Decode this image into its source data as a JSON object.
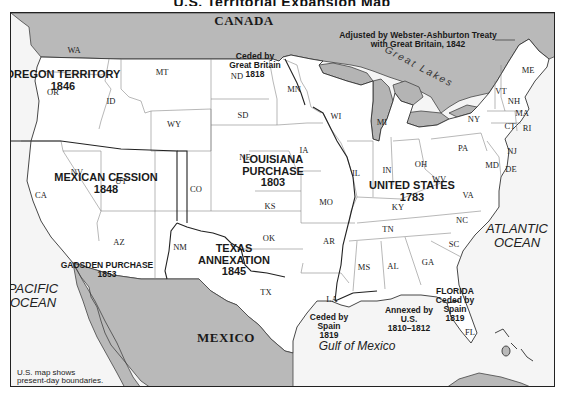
{
  "title_fragment": "U.S. Territorial Expansion Map",
  "colors": {
    "foreign_land": "#b9b9b9",
    "us_land": "#ffffff",
    "water": "#f5f5f5",
    "lakes": "#b4b4b4",
    "state_border": "#777777",
    "acquisition_border": "#222222",
    "frame": "#222222"
  },
  "countries": [
    {
      "id": "canada",
      "label": "CANADA",
      "x": 243,
      "y": 20
    },
    {
      "id": "mexico",
      "label": "MEXICO",
      "x": 225,
      "y": 337
    }
  ],
  "water_bodies": [
    {
      "id": "pacific",
      "label": "PACIFIC\nOCEAN",
      "x": 32,
      "y": 295,
      "cls": "ocean"
    },
    {
      "id": "atlantic",
      "label": "ATLANTIC\nOCEAN",
      "x": 516,
      "y": 235,
      "cls": "ocean"
    },
    {
      "id": "gulf",
      "label": "Gulf of Mexico",
      "x": 356,
      "y": 345,
      "cls": "gulf"
    },
    {
      "id": "great-lakes",
      "label": "Great Lakes",
      "x": 418,
      "y": 66,
      "cls": "lakes"
    }
  ],
  "acquisitions": [
    {
      "id": "oregon-territory",
      "label": "OREGON TERRITORY\n1846",
      "x": 62,
      "y": 80,
      "cls": "region"
    },
    {
      "id": "mexican-cession",
      "label": "MEXICAN CESSION\n1848",
      "x": 105,
      "y": 183,
      "cls": "region"
    },
    {
      "id": "louisiana-purchase",
      "label": "LOUISIANA\nPURCHASE\n1803",
      "x": 272,
      "y": 170,
      "cls": "region"
    },
    {
      "id": "united-states-1783",
      "label": "UNITED STATES\n1783",
      "x": 411,
      "y": 191,
      "cls": "region"
    },
    {
      "id": "texas-annexation",
      "label": "TEXAS\nANNEXATION\n1845",
      "x": 233,
      "y": 259,
      "cls": "region"
    },
    {
      "id": "gadsden-purchase",
      "label": "GADSDEN PURCHASE\n1853",
      "x": 106,
      "y": 269,
      "cls": "region-sm"
    },
    {
      "id": "ceded-by-great-britain",
      "label": "Ceded by\nGreat Britain\n1818",
      "x": 254,
      "y": 64,
      "cls": "region-sm"
    },
    {
      "id": "ceded-by-spain",
      "label": "Ceded by\nSpain\n1819",
      "x": 328,
      "y": 325,
      "cls": "region-sm"
    },
    {
      "id": "annexed-by-us",
      "label": "Annexed by\nU.S.\n1810–1812",
      "x": 408,
      "y": 318,
      "cls": "region-sm"
    },
    {
      "id": "florida",
      "label": "FLORIDA\nCeded by\nSpain\n1819",
      "x": 454,
      "y": 304,
      "cls": "region-sm"
    },
    {
      "id": "webster-ashburton",
      "label": "Adjusted by Webster-Ashburton Treaty\nwith Great Britain, 1842",
      "x": 417,
      "y": 39,
      "cls": "region-sm"
    }
  ],
  "states": [
    {
      "abbr": "WA",
      "x": 73,
      "y": 49
    },
    {
      "abbr": "OR",
      "x": 52,
      "y": 91
    },
    {
      "abbr": "ID",
      "x": 110,
      "y": 100
    },
    {
      "abbr": "MT",
      "x": 161,
      "y": 71
    },
    {
      "abbr": "WY",
      "x": 173,
      "y": 123
    },
    {
      "abbr": "ND",
      "x": 236,
      "y": 75
    },
    {
      "abbr": "SD",
      "x": 242,
      "y": 114
    },
    {
      "abbr": "MN",
      "x": 293,
      "y": 88
    },
    {
      "abbr": "WI",
      "x": 335,
      "y": 115
    },
    {
      "abbr": "MI",
      "x": 381,
      "y": 121
    },
    {
      "abbr": "NE",
      "x": 244,
      "y": 156
    },
    {
      "abbr": "IA",
      "x": 303,
      "y": 149
    },
    {
      "abbr": "IL",
      "x": 355,
      "y": 172
    },
    {
      "abbr": "IN",
      "x": 386,
      "y": 169
    },
    {
      "abbr": "OH",
      "x": 420,
      "y": 163
    },
    {
      "abbr": "PA",
      "x": 462,
      "y": 147
    },
    {
      "abbr": "NY",
      "x": 473,
      "y": 118
    },
    {
      "abbr": "NV",
      "x": 76,
      "y": 171
    },
    {
      "abbr": "UT",
      "x": 120,
      "y": 180
    },
    {
      "abbr": "CA",
      "x": 40,
      "y": 194
    },
    {
      "abbr": "CO",
      "x": 195,
      "y": 188
    },
    {
      "abbr": "KS",
      "x": 269,
      "y": 205
    },
    {
      "abbr": "MO",
      "x": 325,
      "y": 201
    },
    {
      "abbr": "KY",
      "x": 397,
      "y": 206
    },
    {
      "abbr": "WV",
      "x": 438,
      "y": 178
    },
    {
      "abbr": "VA",
      "x": 467,
      "y": 194
    },
    {
      "abbr": "AZ",
      "x": 118,
      "y": 241
    },
    {
      "abbr": "NM",
      "x": 179,
      "y": 246
    },
    {
      "abbr": "OK",
      "x": 268,
      "y": 237
    },
    {
      "abbr": "AR",
      "x": 328,
      "y": 240
    },
    {
      "abbr": "TN",
      "x": 387,
      "y": 228
    },
    {
      "abbr": "NC",
      "x": 461,
      "y": 219
    },
    {
      "abbr": "SC",
      "x": 453,
      "y": 243
    },
    {
      "abbr": "MS",
      "x": 363,
      "y": 266
    },
    {
      "abbr": "AL",
      "x": 392,
      "y": 265
    },
    {
      "abbr": "GA",
      "x": 427,
      "y": 261
    },
    {
      "abbr": "TX",
      "x": 265,
      "y": 291
    },
    {
      "abbr": "LA",
      "x": 331,
      "y": 298
    },
    {
      "abbr": "FL",
      "x": 469,
      "y": 331
    },
    {
      "abbr": "ME",
      "x": 527,
      "y": 69
    },
    {
      "abbr": "VT",
      "x": 500,
      "y": 90
    },
    {
      "abbr": "NH",
      "x": 513,
      "y": 100
    },
    {
      "abbr": "MA",
      "x": 521,
      "y": 112
    },
    {
      "abbr": "CT",
      "x": 509,
      "y": 125
    },
    {
      "abbr": "RI",
      "x": 526,
      "y": 127
    },
    {
      "abbr": "NJ",
      "x": 511,
      "y": 150
    },
    {
      "abbr": "MD",
      "x": 491,
      "y": 164
    },
    {
      "abbr": "DE",
      "x": 510,
      "y": 168
    }
  ],
  "note": {
    "text": "U.S. map shows\npresent-day boundaries.",
    "x": 16,
    "y": 368
  }
}
